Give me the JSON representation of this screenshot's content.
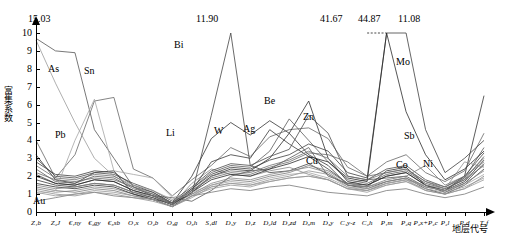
{
  "chart_data": {
    "type": "line",
    "title": "",
    "xlabel": "地层代号",
    "ylabel": "富集系数",
    "ylim": [
      0,
      10
    ],
    "yticks": [
      0,
      1,
      2,
      3,
      4,
      5,
      6,
      7,
      8,
      9,
      10
    ],
    "grid": false,
    "legend": "inline-labels",
    "categories": [
      "Z1b",
      "Z2J",
      "€ny",
      "€gy",
      "€sb",
      "O1x",
      "O2b",
      "O3g",
      "O3h",
      "S1dl",
      "D1y",
      "D2x",
      "D2ld",
      "D2zd",
      "D3m",
      "D3y",
      "C1y-z",
      "C2h",
      "P1m",
      "P2q",
      "P2x+P2c",
      "P2l",
      "P2d",
      "T1f"
    ],
    "category_labels": [
      "Z₁b",
      "Z₂J",
      "€₁ny",
      "€₂gy",
      "€₃sb",
      "O₁x",
      "O₂b",
      "O₃g",
      "O₃h",
      "S₁dl",
      "D₁y",
      "D₁z",
      "D₂ld",
      "D₂zd",
      "D₃m",
      "D₃y",
      "C₁y-z",
      "C₂h",
      "P₁m",
      "P₂q",
      "P₂x+P₂c",
      "P₂l",
      "P₂d",
      "T₁f"
    ],
    "annotations": [
      {
        "text": "15.03",
        "x_index": 0,
        "note": "off-scale peak at left axis"
      },
      {
        "text": "11.90",
        "x_index": 11,
        "note": "off-scale Bi peak"
      },
      {
        "text": "41.67",
        "x_index": 17,
        "note": "off-scale peak"
      },
      {
        "text": "44.87",
        "x_index": 18,
        "note": "off-scale peak"
      },
      {
        "text": "11.08",
        "x_index": 19,
        "note": "off-scale peak"
      }
    ],
    "inline_series_labels": [
      {
        "name": "As",
        "x_index": 1
      },
      {
        "name": "Sn",
        "x_index": 3
      },
      {
        "name": "Pb",
        "x_index": 2
      },
      {
        "name": "Au",
        "x_index": 1
      },
      {
        "name": "Bi",
        "x_index": 10
      },
      {
        "name": "Li",
        "x_index": 8
      },
      {
        "name": "W",
        "x_index": 12
      },
      {
        "name": "Ag",
        "x_index": 14
      },
      {
        "name": "Be",
        "x_index": 15
      },
      {
        "name": "Zn",
        "x_index": 16
      },
      {
        "name": "Cu",
        "x_index": 16
      },
      {
        "name": "Sb",
        "x_index": 20
      },
      {
        "name": "Mo",
        "x_index": 21
      },
      {
        "name": "Co",
        "x_index": 21
      },
      {
        "name": "Ni",
        "x_index": 22
      }
    ],
    "series": [
      {
        "name": "As",
        "color": "#555555",
        "values": [
          9.7,
          9.0,
          8.9,
          4.6,
          3.0,
          1.4,
          0.9,
          0.8,
          0.6,
          1.2,
          2.0,
          2.3,
          2.4,
          3.0,
          3.6,
          2.0,
          1.6,
          1.8,
          1.9,
          2.0,
          1.4,
          1.2,
          1.9,
          3.6
        ]
      },
      {
        "name": "Sn",
        "color": "#333333",
        "values": [
          3.2,
          1.8,
          1.6,
          2.2,
          2.3,
          1.0,
          0.7,
          0.5,
          2.0,
          4.1,
          5.0,
          4.3,
          5.1,
          4.4,
          3.2,
          2.6,
          1.5,
          1.4,
          2.3,
          2.5,
          1.5,
          1.2,
          2.0,
          6.5
        ]
      },
      {
        "name": "Pb",
        "color": "#666666",
        "values": [
          4.0,
          1.9,
          3.2,
          6.2,
          6.4,
          2.4,
          1.9,
          0.9,
          1.8,
          2.6,
          3.6,
          3.1,
          4.2,
          4.6,
          4.7,
          4.1,
          2.5,
          2.0,
          2.8,
          3.2,
          2.2,
          1.7,
          2.3,
          4.4
        ]
      },
      {
        "name": "Au",
        "color": "#777777",
        "values": [
          0.6,
          0.8,
          1.0,
          1.1,
          0.9,
          0.8,
          0.7,
          0.3,
          0.9,
          1.1,
          1.3,
          1.2,
          1.4,
          1.5,
          1.3,
          1.1,
          1.0,
          0.9,
          1.2,
          1.3,
          1.0,
          0.8,
          1.0,
          1.4
        ]
      },
      {
        "name": "Bi",
        "color": "#444444",
        "values": [
          2.1,
          1.6,
          1.5,
          1.8,
          1.7,
          1.2,
          0.9,
          0.5,
          1.0,
          5.4,
          11.9,
          2.6,
          2.2,
          2.3,
          2.7,
          2.1,
          1.5,
          1.3,
          1.7,
          1.9,
          1.3,
          1.0,
          1.5,
          2.4
        ]
      },
      {
        "name": "Li",
        "color": "#888888",
        "values": [
          1.3,
          1.1,
          1.2,
          1.4,
          1.3,
          1.0,
          0.8,
          0.4,
          1.6,
          2.4,
          2.1,
          2.0,
          2.3,
          2.5,
          2.1,
          1.8,
          1.3,
          1.2,
          1.6,
          1.8,
          1.2,
          1.0,
          1.3,
          2.0
        ]
      },
      {
        "name": "W",
        "color": "#3a3a3a",
        "values": [
          1.8,
          1.5,
          1.4,
          1.6,
          1.5,
          1.1,
          0.8,
          0.4,
          1.2,
          2.8,
          3.2,
          3.0,
          4.6,
          3.8,
          3.1,
          2.4,
          1.6,
          1.5,
          2.0,
          2.2,
          1.5,
          1.2,
          1.7,
          2.9
        ]
      },
      {
        "name": "Ag",
        "color": "#5a5a5a",
        "values": [
          2.4,
          1.7,
          1.6,
          2.0,
          1.9,
          1.3,
          1.0,
          0.5,
          1.3,
          2.2,
          2.6,
          2.5,
          3.4,
          5.2,
          4.0,
          2.8,
          1.8,
          1.6,
          2.1,
          2.3,
          1.6,
          1.3,
          1.8,
          3.1
        ]
      },
      {
        "name": "Be",
        "color": "#2e2e2e",
        "values": [
          1.6,
          1.4,
          1.3,
          1.5,
          1.4,
          1.0,
          0.7,
          0.3,
          1.1,
          2.0,
          2.4,
          2.3,
          3.0,
          4.4,
          6.2,
          3.0,
          1.7,
          1.5,
          2.0,
          2.2,
          1.5,
          1.1,
          1.6,
          2.7
        ]
      },
      {
        "name": "Zn",
        "color": "#4a4a4a",
        "values": [
          3.0,
          2.0,
          1.9,
          2.2,
          2.1,
          1.6,
          1.2,
          0.6,
          1.4,
          2.3,
          2.7,
          2.6,
          3.1,
          3.5,
          5.4,
          4.4,
          2.0,
          1.8,
          2.4,
          2.6,
          1.8,
          1.4,
          2.0,
          3.3
        ]
      },
      {
        "name": "Cu",
        "color": "#6a6a6a",
        "values": [
          2.2,
          1.8,
          1.7,
          1.9,
          1.8,
          1.4,
          1.1,
          0.5,
          1.2,
          1.9,
          2.2,
          2.1,
          2.5,
          2.8,
          3.3,
          3.2,
          2.8,
          2.0,
          2.2,
          2.4,
          1.7,
          1.3,
          1.8,
          2.6
        ]
      },
      {
        "name": "Sb",
        "color": "#3f3f3f",
        "values": [
          2.8,
          2.1,
          2.0,
          2.3,
          2.2,
          1.5,
          1.1,
          0.5,
          1.3,
          2.1,
          2.5,
          2.4,
          2.9,
          3.2,
          3.8,
          3.4,
          2.2,
          1.9,
          41.67,
          44.87,
          4.6,
          2.2,
          3.0,
          4.0
        ]
      },
      {
        "name": "Mo",
        "color": "#2a2a2a",
        "values": [
          2.0,
          1.6,
          1.5,
          1.8,
          1.7,
          1.2,
          0.9,
          0.4,
          1.1,
          1.8,
          2.1,
          2.0,
          2.4,
          2.7,
          3.1,
          2.8,
          1.9,
          1.7,
          11.08,
          5.6,
          3.2,
          1.8,
          2.4,
          3.4
        ]
      },
      {
        "name": "Co",
        "color": "#7a7a7a",
        "values": [
          1.4,
          1.2,
          1.1,
          1.3,
          1.2,
          0.9,
          0.7,
          0.3,
          0.9,
          1.5,
          1.8,
          1.7,
          2.0,
          2.2,
          2.6,
          2.3,
          1.6,
          1.4,
          1.8,
          2.0,
          2.6,
          1.5,
          2.0,
          2.8
        ]
      },
      {
        "name": "Ni",
        "color": "#909090",
        "values": [
          1.2,
          1.0,
          0.9,
          1.1,
          1.0,
          0.8,
          0.6,
          0.3,
          0.8,
          1.4,
          1.6,
          1.5,
          1.8,
          2.0,
          2.3,
          2.1,
          1.4,
          1.2,
          1.6,
          1.8,
          1.5,
          1.3,
          2.8,
          2.5
        ]
      },
      {
        "name": "Sr",
        "color": "#9a9a9a",
        "values": [
          9.6,
          7.2,
          5.0,
          3.0,
          2.0,
          1.5,
          1.2,
          0.7,
          1.0,
          1.4,
          1.6,
          1.5,
          1.7,
          1.9,
          2.0,
          1.8,
          1.3,
          1.2,
          1.5,
          1.7,
          1.3,
          1.1,
          1.4,
          1.9
        ]
      },
      {
        "name": "Ba",
        "color": "#a5a5a5",
        "values": [
          1.0,
          1.2,
          4.0,
          6.3,
          2.3,
          2.1,
          1.9,
          0.8,
          1.1,
          1.5,
          1.7,
          1.6,
          1.9,
          2.1,
          2.2,
          1.9,
          1.4,
          1.3,
          1.6,
          1.8,
          1.4,
          1.2,
          1.5,
          2.1
        ]
      },
      {
        "name": "Cr",
        "color": "#858585",
        "values": [
          1.5,
          1.3,
          1.4,
          1.6,
          1.5,
          1.1,
          0.9,
          0.4,
          1.0,
          1.6,
          1.9,
          1.8,
          2.1,
          2.3,
          2.5,
          2.2,
          1.5,
          1.4,
          1.7,
          1.9,
          1.4,
          1.2,
          1.6,
          2.3
        ]
      },
      {
        "name": "V",
        "color": "#989898",
        "values": [
          1.1,
          0.9,
          1.0,
          1.2,
          1.1,
          0.9,
          0.7,
          0.3,
          0.9,
          1.3,
          1.5,
          1.4,
          1.7,
          1.9,
          2.0,
          1.8,
          1.3,
          1.1,
          1.5,
          1.7,
          1.2,
          1.0,
          1.3,
          1.8
        ]
      },
      {
        "name": "Hg",
        "color": "#707070",
        "values": [
          2.6,
          1.9,
          1.8,
          2.1,
          2.0,
          1.4,
          1.0,
          0.5,
          1.2,
          2.0,
          2.3,
          2.2,
          2.6,
          2.9,
          3.4,
          3.0,
          2.0,
          1.8,
          2.2,
          2.4,
          1.7,
          1.4,
          1.9,
          3.0
        ]
      }
    ]
  },
  "axis": {
    "y_label": "富集系数",
    "x_label": "地层代号",
    "y_tick_labels": [
      "0",
      "1",
      "2",
      "3",
      "4",
      "5",
      "6",
      "7",
      "8",
      "9",
      "10"
    ]
  }
}
